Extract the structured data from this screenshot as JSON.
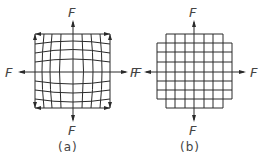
{
  "figure": {
    "panels": [
      {
        "id": "a",
        "caption": "(a)",
        "description": "curved (distorted) grid under four outward forces with corner arrows",
        "forces": {
          "top": "F",
          "bottom": "F",
          "left": "F",
          "right": "F"
        }
      },
      {
        "id": "b",
        "caption": "(b)",
        "description": "rectangular grid under four outward forces",
        "forces": {
          "top": "F",
          "bottom": "F",
          "left": "F",
          "right": "F"
        }
      }
    ],
    "colors": {
      "line": "#2a2a2a",
      "text": "#444444",
      "background": "#ffffff"
    }
  }
}
